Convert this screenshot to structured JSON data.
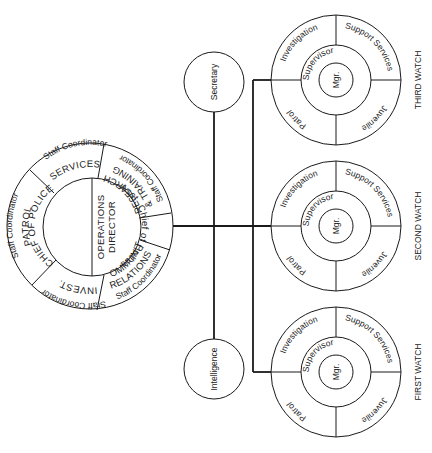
{
  "diagram": {
    "type": "organizational-chart",
    "colors": {
      "line": "#1a1a1a",
      "text": "#222222",
      "background": "#ffffff"
    },
    "command_circle": {
      "inner": {
        "left_label": "CHIEF OF POLICE",
        "right_label_1": "OPERATIONS",
        "right_label_2": "DIRECTOR",
        "right_arc_label": "Asst. Chief of Police"
      },
      "outer_segments": [
        {
          "name": "services",
          "title": "SERVICES",
          "subtitle": "Staff Coordinator"
        },
        {
          "name": "patrol",
          "title": "PATROL",
          "subtitle": "Staff Coordinator"
        },
        {
          "name": "invest",
          "title": "INVEST.",
          "subtitle": "Staff Coordinator"
        },
        {
          "name": "community-relations",
          "title_1": "COMMUNITY",
          "title_2": "RELATIONS",
          "subtitle": "Staff Coordinator"
        },
        {
          "name": "research-training",
          "title_1": "RESEARCH",
          "title_2": "& TRAINING",
          "subtitle": "Staff Coordinator"
        }
      ]
    },
    "staff_units": [
      {
        "name": "secretary",
        "label": "Secretary"
      },
      {
        "name": "intelligence",
        "label": "Intelligence"
      }
    ],
    "watches": [
      {
        "name": "third-watch",
        "title": "THIRD WATCH",
        "center": "Mgr.",
        "ring": "Supervisor",
        "quadrants": [
          "Investigation",
          "Support Services",
          "Juvenile",
          "Patrol"
        ]
      },
      {
        "name": "second-watch",
        "title": "SECOND WATCH",
        "center": "Mgr.",
        "ring": "Supervisor",
        "quadrants": [
          "Investigation",
          "Support Services",
          "Juvenile",
          "Patrol"
        ]
      },
      {
        "name": "first-watch",
        "title": "FIRST WATCH",
        "center": "Mgr.",
        "ring": "Supervisor",
        "quadrants": [
          "Investigation",
          "Support Services",
          "Juvenile",
          "Patrol"
        ]
      }
    ]
  }
}
